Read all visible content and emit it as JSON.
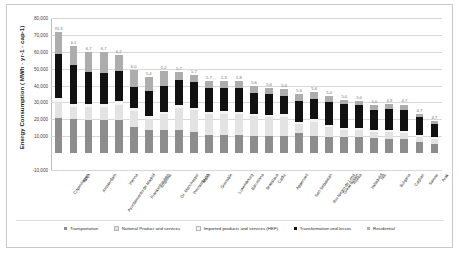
{
  "chart_data": {
    "type": "bar",
    "subtype": "stacked-column",
    "title": "",
    "xlabel": "",
    "ylabel": "Energy Consumption ( MWh · yr-1 · cap-1)",
    "ylim": [
      -10000,
      80000
    ],
    "yticks": [
      "-10,000",
      "10,000",
      "20,000",
      "30,000",
      "40,000",
      "50,000",
      "60,000",
      "70,000",
      "80,000"
    ],
    "ytick_values": [
      -10000,
      10000,
      20000,
      30000,
      40000,
      50000,
      60000,
      70000,
      80000
    ],
    "grid": true,
    "legend_position": "bottom",
    "categories": [
      "Copenhagen",
      "Vaxjo",
      "Amsterdam",
      "Ayuntamiento de Madrid",
      "Vienna",
      "Frankenhausen",
      "Arraiolos",
      "Gr. Manchester",
      "Pernambuco",
      "Malta",
      "Grenoble",
      "Luxembourg",
      "Barcelona",
      "Bratislava",
      "Cadiz",
      "Appenzell",
      "San Sebastian",
      "Rio Negro de Lima",
      "Great Britain",
      "Rijeka",
      "Valladolid",
      "Niš",
      "Bulgaria",
      "Cagliari",
      "Samos",
      "Arak"
    ],
    "series": [
      {
        "name": "Transportation",
        "color": "#8d8d8d",
        "values": [
          21000,
          20500,
          19500,
          19600,
          19800,
          15200,
          13500,
          13600,
          13700,
          12500,
          10500,
          10600,
          10700,
          10400,
          10200,
          10300,
          11800,
          10100,
          9300,
          9400,
          9500,
          8700,
          8200,
          8300,
          6600,
          5600
        ]
      },
      {
        "name": "National Product and services",
        "color": "#e3e3e3",
        "values": [
          9200,
          6900,
          8100,
          7900,
          9000,
          9800,
          6900,
          9500,
          13200,
          13000,
          12500,
          12600,
          12400,
          11500,
          11200,
          11300,
          5300,
          8500,
          6300,
          4400,
          4200,
          4000,
          4100,
          3900,
          3200,
          3000
        ]
      },
      {
        "name": "Imported products and services (HEF)",
        "color": "#f4f4f4",
        "values": [
          2600,
          1600,
          1700,
          1700,
          1800,
          1600,
          1500,
          1500,
          1500,
          1500,
          1500,
          1500,
          1500,
          1400,
          1400,
          1400,
          1400,
          1400,
          1300,
          1300,
          1300,
          1200,
          1200,
          1200,
          1000,
          900
        ]
      },
      {
        "name": "Transformation and losses",
        "color": "#111111",
        "values": [
          26000,
          23500,
          18500,
          18500,
          18000,
          12500,
          14800,
          14900,
          14800,
          14900,
          14200,
          14000,
          14100,
          12500,
          12000,
          11000,
          12500,
          12200,
          13200,
          13800,
          13600,
          11400,
          12500,
          12400,
          10500,
          8000
        ]
      },
      {
        "name": "Residential",
        "color": "#adadad",
        "values": [
          13200,
          10700,
          12200,
          12300,
          9400,
          10200,
          8600,
          9000,
          4800,
          4300,
          4300,
          4300,
          4200,
          4000,
          3900,
          3800,
          3800,
          3800,
          3700,
          2400,
          2300,
          3200,
          3100,
          3000,
          2000,
          1800
        ]
      }
    ],
    "data_labels": [
      "70,3",
      "6,1",
      "6,7",
      "6,7",
      "6,2",
      "6,0",
      "5,4",
      "5,2",
      "5,7",
      "5,7",
      "5,7",
      "5,3",
      "5,8",
      "5,6",
      "5,6",
      "5,6",
      "5,6",
      "5,6",
      "5,0",
      "5,0",
      "5,0",
      "5,0",
      "4,9",
      "4,7",
      "4,7",
      "4,7",
      "4,5",
      "4,1"
    ]
  },
  "legend": {
    "items": [
      {
        "label": "Transportation",
        "color": "#8d8d8d"
      },
      {
        "label": "National Product and services",
        "color": "#e3e3e3"
      },
      {
        "label": "Imported products and services (HEF)",
        "color": "#f4f4f4"
      },
      {
        "label": "Transformation and losses",
        "color": "#111111"
      },
      {
        "label": "Residential",
        "color": "#adadad"
      }
    ]
  }
}
